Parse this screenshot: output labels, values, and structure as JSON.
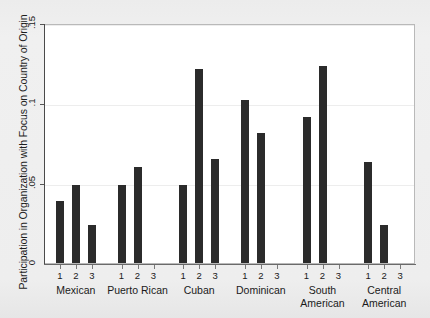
{
  "chart_data": {
    "type": "bar",
    "title": "",
    "subtitle": "",
    "xlabel": "",
    "ylabel": "Participation in Organization with Focus on Country of Origin",
    "ylim": [
      0,
      0.15
    ],
    "yticks": [
      0,
      0.05,
      0.1,
      0.15
    ],
    "ytick_labels": [
      "0",
      ".05",
      ".1",
      ".15"
    ],
    "grid": true,
    "legend": "none",
    "groups": [
      "Mexican",
      "Puerto Rican",
      "Cuban",
      "Dominican",
      "South American",
      "Central American"
    ],
    "group_labels_display": [
      "Mexican",
      "Puerto Rican",
      "Cuban",
      "Dominican",
      "South\nAmerican",
      "Central\nAmerican"
    ],
    "subcategories": [
      "1",
      "2",
      "3"
    ],
    "series": [
      {
        "name": "1",
        "values": [
          0.039,
          0.049,
          0.049,
          0.102,
          0.091,
          0.063
        ]
      },
      {
        "name": "2",
        "values": [
          0.049,
          0.06,
          0.121,
          0.081,
          0.123,
          0.024
        ]
      },
      {
        "name": "3",
        "values": [
          0.024,
          0.0,
          0.065,
          0.0,
          0.0,
          0.0
        ]
      }
    ],
    "bar_color": "#2b2b2b",
    "plot_background": "#ffffff",
    "page_background": "#eeeeee",
    "annotations": []
  }
}
